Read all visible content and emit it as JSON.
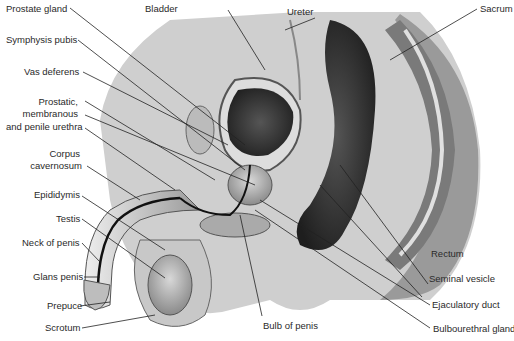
{
  "figure": {
    "labels": {
      "prostate_gland": "Prostate gland",
      "bladder": "Bladder",
      "ureter": "Ureter",
      "sacrum": "Sacrum",
      "symphysis_pubis": "Symphysis pubis",
      "vas_deferens": "Vas deferens",
      "urethra_1": "Prostatic,",
      "urethra_2": "membranous",
      "urethra_3": "and penile urethra",
      "corpus_1": "Corpus",
      "corpus_2": "cavernosum",
      "epididymis": "Epididymis",
      "testis": "Testis",
      "neck_of_penis": "Neck of penis",
      "glans_penis": "Glans penis",
      "prepuce": "Prepuce",
      "scrotum": "Scrotum",
      "bulb_of_penis": "Bulb of penis",
      "rectum": "Rectum",
      "seminal_vesicle": "Seminal vesicle",
      "ejaculatory_duct": "Ejaculatory duct",
      "bulbourethral_gland": "Bulbourethral gland"
    }
  }
}
